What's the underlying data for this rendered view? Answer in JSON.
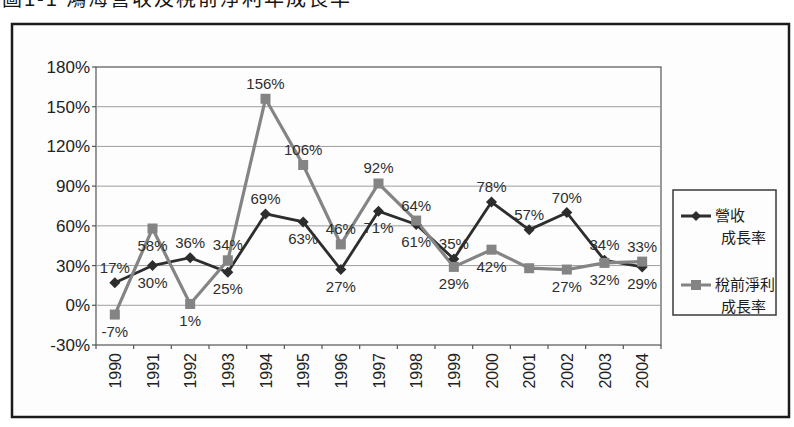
{
  "page": {
    "partial_title": "圖1-1 鴻海營收及稅前淨利年成長率"
  },
  "chart_data": {
    "type": "line",
    "title": "圖1-1 鴻海營收及稅前淨利年成長率",
    "categories": [
      "1990",
      "1991",
      "1992",
      "1993",
      "1994",
      "1995",
      "1996",
      "1997",
      "1998",
      "1999",
      "2000",
      "2001",
      "2002",
      "2003",
      "2004"
    ],
    "y_axis": {
      "tick_labels": [
        "180%",
        "150%",
        "120%",
        "90%",
        "60%",
        "30%",
        "0%",
        "-30%"
      ],
      "min": -30,
      "max": 180,
      "step": 30,
      "unit": "%"
    },
    "x_axis": {
      "label_rotation": -90
    },
    "grid": true,
    "legend_position": "right",
    "series": [
      {
        "name": "營收成長率",
        "legend_lines": [
          "營收",
          "成長率"
        ],
        "marker": "diamond",
        "color": "#2d2d2d",
        "values": [
          17,
          30,
          36,
          25,
          69,
          63,
          27,
          71,
          61,
          35,
          78,
          57,
          70,
          34,
          29
        ],
        "labels": [
          "17%",
          "30%",
          "36%",
          "25%",
          "69%",
          "63%",
          "27%",
          "71%",
          "61%",
          "35%",
          "78%",
          "57%",
          "70%",
          "34%",
          "29%"
        ],
        "label_side": [
          "above",
          "below",
          "above",
          "below",
          "above",
          "below",
          "below",
          "below",
          "below",
          "above",
          "above",
          "above",
          "above",
          "above",
          "below"
        ]
      },
      {
        "name": "稅前淨利成長率",
        "legend_lines": [
          "稅前淨利",
          "成長率"
        ],
        "marker": "square",
        "color": "#848484",
        "values": [
          -7,
          58,
          1,
          34,
          156,
          106,
          46,
          92,
          64,
          29,
          42,
          28,
          27,
          32,
          33
        ],
        "labels": [
          "-7%",
          "58%",
          "1%",
          "34%",
          "156%",
          "106%",
          "46%",
          "92%",
          "64%",
          "29%",
          "42%",
          "",
          "27%",
          "32%",
          "33%"
        ],
        "label_side": [
          "below",
          "below",
          "below",
          "above",
          "above",
          "above",
          "above",
          "above",
          "above",
          "below",
          "below",
          "none",
          "below",
          "below",
          "above"
        ]
      }
    ],
    "colors": {
      "frame_border": "#1b1b1b",
      "plot_border": "#555555",
      "gridline": "#9e9e9e",
      "background": "#fdfdfd",
      "label_text": "#2e2e2e",
      "axis_text": "#222222"
    }
  }
}
